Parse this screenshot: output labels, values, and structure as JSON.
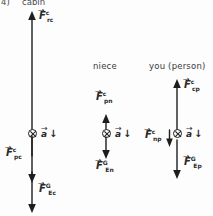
{
  "figure": {
    "title_clipped": "cabin",
    "item_marker": "4)",
    "accel_symbol": "a",
    "accel_arrow": "↓",
    "vector_overbar": "→"
  },
  "columns": [
    {
      "id": "cabin",
      "header": "cabin",
      "header_clipped": true,
      "com_label": "center-of-mass",
      "accel": {
        "symbol": "a",
        "direction": "down"
      },
      "forces": [
        {
          "name": "F",
          "sup": "c",
          "sub": "rc",
          "direction": "up",
          "meaning": "contact force of rope on cabin"
        },
        {
          "name": "F",
          "sup": "c",
          "sub": "pc",
          "direction": "down",
          "meaning": "contact force of person on cabin"
        },
        {
          "name": "F",
          "sup": "G",
          "sub": "Ec",
          "direction": "down",
          "meaning": "gravitational force of Earth on cabin"
        }
      ]
    },
    {
      "id": "niece",
      "header": "niece",
      "header_clipped": false,
      "com_label": "center-of-mass",
      "accel": {
        "symbol": "a",
        "direction": "down"
      },
      "forces": [
        {
          "name": "F",
          "sup": "c",
          "sub": "pn",
          "direction": "up",
          "meaning": "contact force of person on niece"
        },
        {
          "name": "F",
          "sup": "G",
          "sub": "En",
          "direction": "down",
          "meaning": "gravitational force of Earth on niece"
        }
      ]
    },
    {
      "id": "person",
      "header": "you (person)",
      "header_clipped": false,
      "com_label": "center-of-mass",
      "accel": {
        "symbol": "a",
        "direction": "down"
      },
      "forces": [
        {
          "name": "F",
          "sup": "c",
          "sub": "cp",
          "direction": "up",
          "meaning": "contact force of cabin on person"
        },
        {
          "name": "F",
          "sup": "c",
          "sub": "np",
          "direction": "down",
          "meaning": "contact force of niece on person"
        },
        {
          "name": "F",
          "sup": "G",
          "sub": "Ep",
          "direction": "down",
          "meaning": "gravitational force of Earth on person"
        }
      ]
    }
  ]
}
